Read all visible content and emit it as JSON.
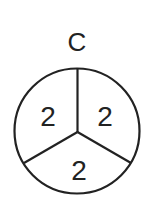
{
  "diagram": {
    "title": "C",
    "segments": [
      {
        "position": "top-left",
        "value": "2"
      },
      {
        "position": "top-right",
        "value": "2"
      },
      {
        "position": "bottom",
        "value": "2"
      }
    ],
    "stroke_color": "#222222",
    "background": "#ffffff"
  }
}
